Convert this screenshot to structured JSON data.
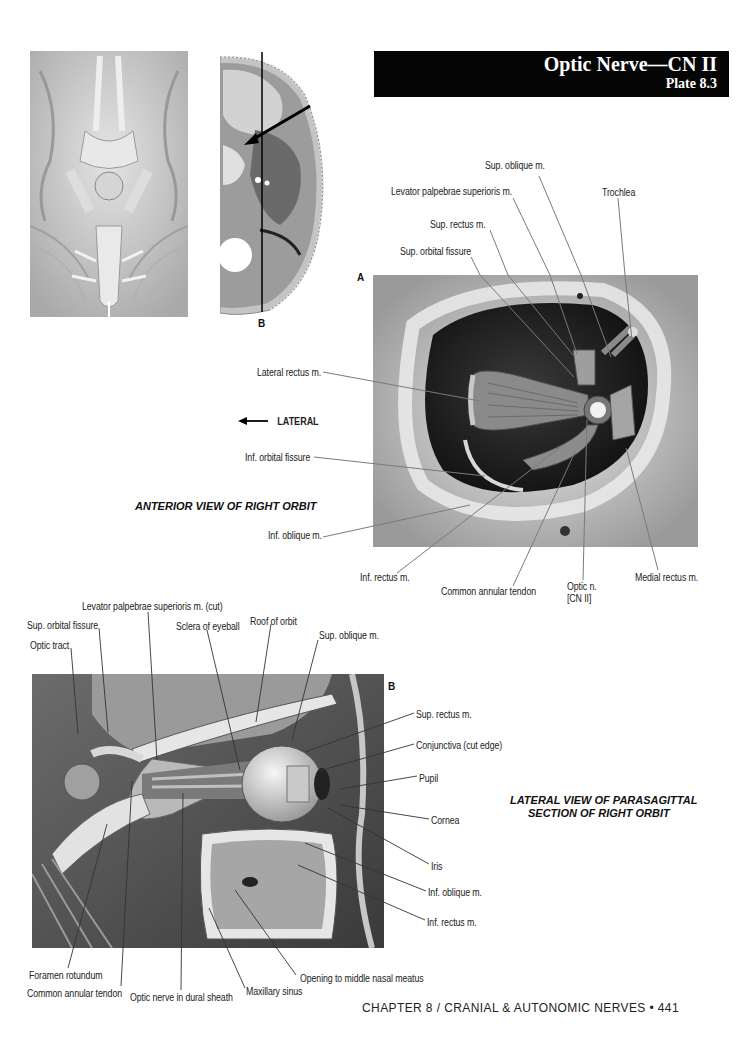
{
  "header": {
    "title": "Optic Nerve—CN II",
    "plate": "Plate 8.3"
  },
  "figure_a": {
    "letter": "A",
    "caption": "ANTERIOR VIEW OF RIGHT ORBIT",
    "direction_label": "LATERAL",
    "labels": {
      "sup_oblique": "Sup. oblique m.",
      "levator": "Levator palpebrae superioris m.",
      "trochlea": "Trochlea",
      "sup_rectus": "Sup. rectus m.",
      "sup_orbital_fissure": "Sup. orbital fissure",
      "lateral_rectus": "Lateral rectus m.",
      "inf_orbital_fissure": "Inf. orbital fissure",
      "inf_oblique": "Inf. oblique m.",
      "inf_rectus": "Inf. rectus m.",
      "common_annular_tendon": "Common annular tendon",
      "optic_n_line1": "Optic n.",
      "optic_n_line2": "[CN II]",
      "medial_rectus": "Medial rectus m."
    }
  },
  "orientation": {
    "section_letter": "B"
  },
  "figure_b": {
    "letter": "B",
    "caption_line1": "LATERAL VIEW OF PARASAGITTAL",
    "caption_line2": "SECTION OF RIGHT ORBIT",
    "labels": {
      "levator_cut": "Levator palpebrae superioris m. (cut)",
      "sup_orbital_fissure": "Sup. orbital fissure",
      "sclera": "Sclera of eyeball",
      "roof_of_orbit": "Roof of orbit",
      "optic_tract": "Optic tract",
      "sup_oblique": "Sup. oblique m.",
      "sup_rectus": "Sup. rectus m.",
      "conjunctiva": "Conjunctiva (cut edge)",
      "pupil": "Pupil",
      "cornea": "Cornea",
      "iris": "Iris",
      "inf_oblique": "Inf. oblique m.",
      "inf_rectus": "Inf. rectus m.",
      "foramen_rotundum": "Foramen rotundum",
      "common_annular_tendon": "Common annular tendon",
      "optic_nerve_dural": "Optic nerve in dural sheath",
      "maxillary_sinus": "Maxillary sinus",
      "opening_nasal_meatus": "Opening to middle nasal meatus"
    }
  },
  "footer": {
    "text": "CHAPTER 8 / CRANIAL & AUTONOMIC NERVES • 441"
  }
}
